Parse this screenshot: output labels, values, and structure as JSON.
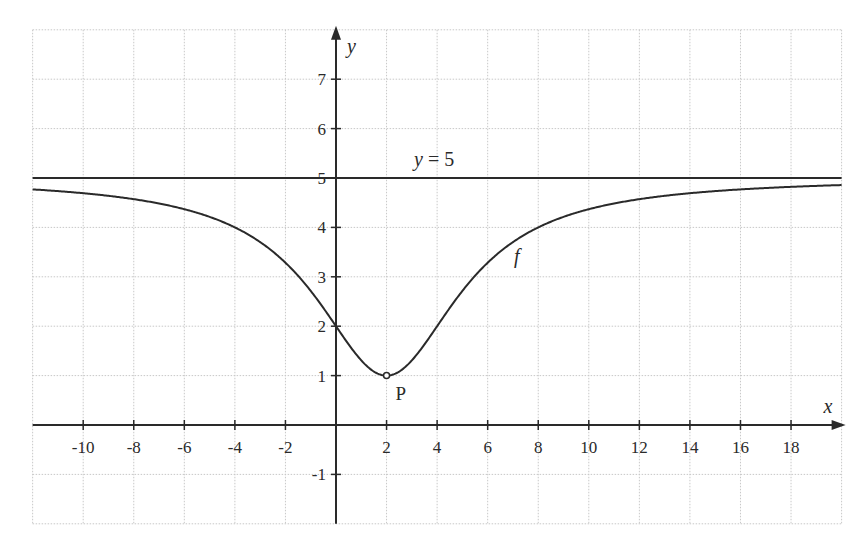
{
  "chart_data": {
    "type": "line",
    "title": "",
    "xlabel": "x",
    "ylabel": "y",
    "xlim": [
      -12,
      20
    ],
    "ylim": [
      -2,
      8
    ],
    "grid": true,
    "grid_style": "dotted light gray, 2-unit spacing in x, 1-unit spacing in y",
    "x_ticks": [
      -10,
      -8,
      -6,
      -4,
      -2,
      2,
      4,
      6,
      8,
      10,
      12,
      14,
      16,
      18
    ],
    "x_tick_labels": [
      "-10",
      "-8",
      "-6",
      "-4",
      "-2",
      "2",
      "4",
      "6",
      "8",
      "10",
      "12",
      "14",
      "16",
      "18"
    ],
    "y_ticks": [
      -1,
      1,
      2,
      3,
      4,
      5,
      6,
      7
    ],
    "y_tick_labels": [
      "-1",
      "1",
      "2",
      "3",
      "4",
      "5",
      "6",
      "7"
    ],
    "series": [
      {
        "name": "f",
        "description": "Smooth curve approaching y=5 on both sides, minimum value 1 at x=2 (open circle, point P), passes through (0,2)",
        "model": "f(x) = 5 - 4/(1 + (x-2)^2/12)",
        "x": [
          -12,
          -10,
          -8,
          -6,
          -4,
          -2,
          0,
          1,
          2,
          3,
          4,
          6,
          8,
          10,
          12,
          14,
          16,
          18,
          20
        ],
        "values": [
          4.76,
          4.69,
          4.59,
          4.42,
          4.0,
          3.29,
          2.0,
          1.35,
          1.0,
          1.35,
          2.0,
          3.29,
          4.0,
          4.42,
          4.59,
          4.69,
          4.76,
          4.8,
          4.84
        ]
      },
      {
        "name": "y = 5",
        "description": "Horizontal asymptote",
        "x": [
          -12,
          20
        ],
        "values": [
          5,
          5
        ]
      }
    ],
    "annotations": [
      {
        "text": "y = 5",
        "x": 3.5,
        "y": 5.3
      },
      {
        "text": "f",
        "x": 7.3,
        "y": 3.4
      },
      {
        "text": "P",
        "x": 2.5,
        "y": 0.65,
        "point": [
          2,
          1
        ],
        "marker": "open-circle"
      }
    ],
    "legend": null
  },
  "labels": {
    "x_axis": "x",
    "y_axis": "y",
    "asymptote": "y = 5",
    "function": "f",
    "point": "P"
  },
  "colors": {
    "background": "#ffffff",
    "grid": "#c8c8c8",
    "axis": "#2a2a2a",
    "curve": "#2a2a2a"
  }
}
